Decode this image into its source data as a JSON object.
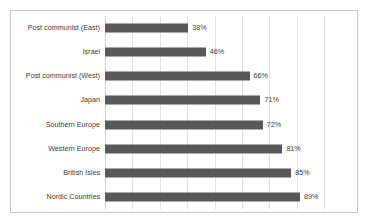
{
  "chart_data": {
    "type": "bar",
    "orientation": "horizontal",
    "title": "",
    "subtitle": "",
    "xlabel": "",
    "ylabel": "",
    "xlim": [
      0,
      100
    ],
    "grid": "vertical",
    "legend": "none",
    "value_suffix": "%",
    "categories": [
      "Post communist (East)",
      "Israel",
      "Post communist (West)",
      "Japan",
      "Southern Europe",
      "Western Europe",
      "British Isles",
      "Nordic Countries"
    ],
    "values": [
      38,
      46,
      66,
      71,
      72,
      81,
      85,
      89
    ],
    "value_labels": [
      "38%",
      "46%",
      "66%",
      "71%",
      "72%",
      "81%",
      "85%",
      "89%"
    ],
    "gridline_values": [
      0,
      12.5,
      25,
      37.5,
      50,
      62.5,
      75,
      87.5,
      100
    ],
    "colors": {
      "bar": "#595959",
      "gridline": "#e2e2e2",
      "border": "#c8c8c8",
      "background": "#ffffff",
      "category_text": "#404040",
      "value_text": "#3a3a3a"
    }
  }
}
